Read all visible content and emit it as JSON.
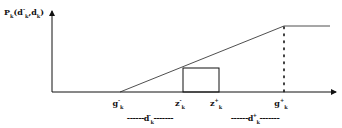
{
  "diagram": {
    "y_axis_label": {
      "main": "P",
      "sub": "k",
      "args_open": "(d",
      "arg1_sup": "-",
      "arg1_sub": "k",
      "comma": ",d",
      "arg2_sub": "k",
      "args_close": ")"
    },
    "ticks": [
      {
        "main": "g",
        "sup": "-",
        "sub": "k"
      },
      {
        "main": "z",
        "sup": "-",
        "sub": "k"
      },
      {
        "main": "z",
        "sup": "+",
        "sub": "k"
      },
      {
        "main": "g",
        "sup": "+",
        "sub": "k"
      }
    ],
    "ranges": [
      {
        "dash_left": "------",
        "main": "d",
        "sup": "-",
        "sub": "k",
        "dash_right": "-------"
      },
      {
        "dash_left": "------",
        "main": "d",
        "sup": "+",
        "sub": "k",
        "dash_right": "-------"
      }
    ],
    "colors": {
      "line": "#111111",
      "background": "#ffffff"
    }
  }
}
